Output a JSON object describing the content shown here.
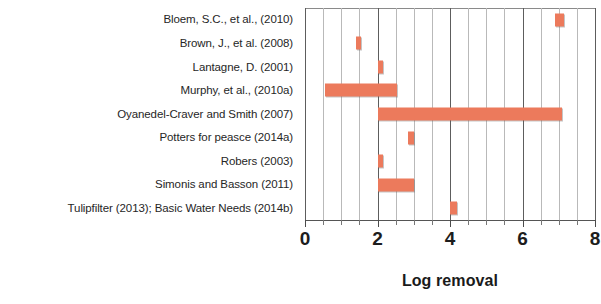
{
  "chart_data": {
    "type": "bar",
    "orientation": "horizontal",
    "bar_style": "floating-range",
    "title": "",
    "subtitle": "",
    "xlabel": "Log removal",
    "ylabel": "",
    "xlim": [
      0,
      8
    ],
    "xticks": [
      0,
      2,
      4,
      6,
      8
    ],
    "xtick_labels": [
      "0",
      "2",
      "4",
      "6",
      "8"
    ],
    "minor_tick_step": 0.5,
    "grid": true,
    "grid_axis": "x",
    "legend": null,
    "bar_color": "#ec7a5c",
    "grid_color": "#b9b9b9",
    "major_grid_color": "#5d5d5d",
    "categories": [
      "Bloem, S.C., et al., (2010)",
      "Brown, J., et al. (2008)",
      "Lantagne, D. (2001)",
      "Murphy, et al., (2010a)",
      "Oyanedel-Craver and Smith (2007)",
      "Potters for peasce (2014a)",
      "Robers (2003)",
      "Simonis and Basson (2011)",
      "Tulipfilter (2013); Basic Water Needs (2014b)"
    ],
    "ranges": [
      {
        "category": "Bloem, S.C., et al., (2010)",
        "start": 6.9,
        "end": 7.15
      },
      {
        "category": "Brown, J., et al. (2008)",
        "start": 1.4,
        "end": 1.55
      },
      {
        "category": "Lantagne, D. (2001)",
        "start": 2.0,
        "end": 2.15
      },
      {
        "category": "Murphy, et al., (2010a)",
        "start": 0.55,
        "end": 2.55
      },
      {
        "category": "Oyanedel-Craver and Smith (2007)",
        "start": 2.0,
        "end": 7.1
      },
      {
        "category": "Potters for peasce (2014a)",
        "start": 2.85,
        "end": 3.0
      },
      {
        "category": "Robers (2003)",
        "start": 2.0,
        "end": 2.15
      },
      {
        "category": "Simonis and Basson (2011)",
        "start": 2.0,
        "end": 3.0
      },
      {
        "category": "Tulipfilter (2013); Basic Water Needs (2014b)",
        "start": 4.0,
        "end": 4.18
      }
    ],
    "values": [
      7.15,
      1.55,
      2.15,
      2.55,
      7.1,
      3.0,
      2.15,
      3.0,
      4.18
    ]
  }
}
